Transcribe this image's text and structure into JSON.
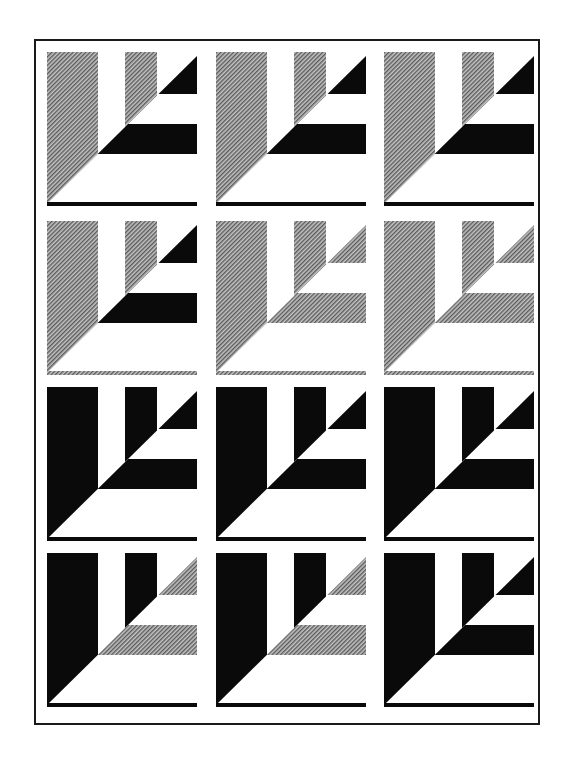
{
  "figure": {
    "colors": {
      "black": "#0a0a0a",
      "gray": "#9a9a9a",
      "white": "#ffffff",
      "frame": "#1a1a1a"
    },
    "rows": [
      [
        {
          "verticals": "gray",
          "accents": "black",
          "baseline": "black"
        },
        {
          "verticals": "gray",
          "accents": "black",
          "baseline": "black"
        },
        {
          "verticals": "gray",
          "accents": "black",
          "baseline": "black"
        }
      ],
      [
        {
          "verticals": "gray",
          "accents": "black",
          "baseline": "gray"
        },
        {
          "verticals": "gray",
          "accents": "gray",
          "baseline": "gray"
        },
        {
          "verticals": "gray",
          "accents": "gray",
          "baseline": "gray"
        }
      ],
      [
        {
          "verticals": "black",
          "accents": "black",
          "baseline": "black"
        },
        {
          "verticals": "black",
          "accents": "black",
          "baseline": "black"
        },
        {
          "verticals": "black",
          "accents": "black",
          "baseline": "black"
        }
      ],
      [
        {
          "verticals": "black",
          "accents": "gray",
          "baseline": "black"
        },
        {
          "verticals": "black",
          "accents": "gray",
          "baseline": "black"
        },
        {
          "verticals": "black",
          "accents": "black",
          "baseline": "black"
        }
      ]
    ]
  }
}
